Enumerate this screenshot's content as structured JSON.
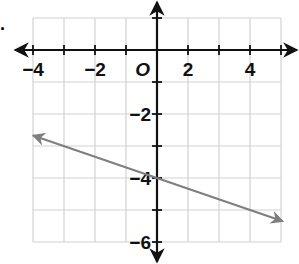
{
  "problem_marker": ".",
  "chart_data": {
    "type": "line",
    "title": "",
    "xlabel": "",
    "ylabel": "",
    "xlim": [
      -4,
      4
    ],
    "ylim": [
      -6,
      1
    ],
    "grid": true,
    "origin_label": "O",
    "x_tick_labels": [
      {
        "label": "−4",
        "px": 33
      },
      {
        "label": "−2",
        "px": 95
      },
      {
        "label": "2",
        "px": 188
      },
      {
        "label": "4",
        "px": 250
      }
    ],
    "y_tick_labels": [
      {
        "label": "−2",
        "value": -2
      },
      {
        "label": "−4",
        "value": -4
      },
      {
        "label": "−6",
        "value": -6
      }
    ],
    "series": [
      {
        "name": "line",
        "equation": "y = -x/3 - 4",
        "x": [
          -4,
          4.06
        ],
        "y": [
          -2.67,
          -5.35
        ],
        "arrows": "both",
        "color": "#7f7f7f"
      }
    ]
  },
  "colors": {
    "axis": "#111111",
    "grid": "#d2d2d2",
    "line": "#7f7f7f"
  }
}
